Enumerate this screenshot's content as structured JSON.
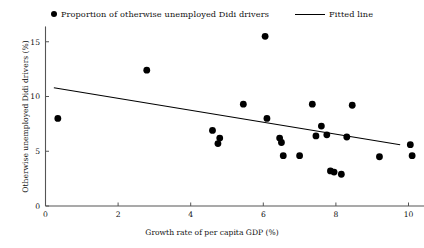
{
  "chart_data": {
    "type": "scatter",
    "title": "",
    "xlabel": "Growth rate of per capita GDP  (%)",
    "ylabel": "Otherwise unemployed Didi drivers (%)",
    "xlim": [
      -0.15,
      10.6
    ],
    "ylim": [
      0,
      16.4
    ],
    "xticks": [
      0,
      2,
      4,
      6,
      8,
      10
    ],
    "xtick_labels": [
      "0",
      "2",
      "4",
      "6",
      "8",
      "10"
    ],
    "yticks": [
      0,
      5,
      10,
      15
    ],
    "ytick_labels": [
      "0",
      "5",
      "10",
      "15"
    ],
    "grid": false,
    "legend_position": "top-center",
    "series": [
      {
        "name": "Proportion of otherwise unemployed Didi drivers",
        "type": "scatter",
        "marker": "filled-circle",
        "color": "#000000",
        "points": [
          [
            0.34,
            8.0
          ],
          [
            2.79,
            12.4
          ],
          [
            4.6,
            6.9
          ],
          [
            4.75,
            5.7
          ],
          [
            4.8,
            6.2
          ],
          [
            5.45,
            9.3
          ],
          [
            6.05,
            15.5
          ],
          [
            6.1,
            8.0
          ],
          [
            6.45,
            6.2
          ],
          [
            6.5,
            5.8
          ],
          [
            6.55,
            4.6
          ],
          [
            7.0,
            4.6
          ],
          [
            7.35,
            9.3
          ],
          [
            7.45,
            6.4
          ],
          [
            7.6,
            7.3
          ],
          [
            7.75,
            6.5
          ],
          [
            7.85,
            3.2
          ],
          [
            7.95,
            3.1
          ],
          [
            8.15,
            2.9
          ],
          [
            8.3,
            6.3
          ],
          [
            8.45,
            9.2
          ],
          [
            9.2,
            4.5
          ],
          [
            10.05,
            5.6
          ],
          [
            10.1,
            4.6
          ]
        ]
      },
      {
        "name": "Fitted line",
        "type": "line",
        "color": "#000000",
        "x": [
          0.23,
          9.77
        ],
        "y": [
          10.8,
          5.6
        ]
      }
    ]
  },
  "legend": {
    "scatter_label": "Proportion of otherwise unemployed Didi drivers",
    "line_label": "Fitted line"
  }
}
